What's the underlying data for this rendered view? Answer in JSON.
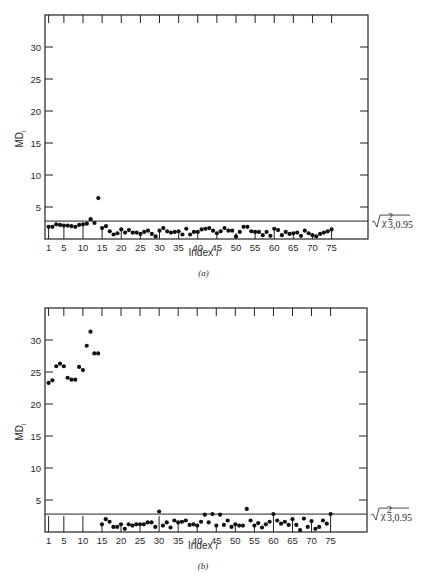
{
  "chart_data": [
    {
      "type": "scatter",
      "panel": "(a)",
      "caption": "(a)",
      "xlabel": "Index i",
      "ylabel": "MD_i",
      "xlim": [
        0,
        80
      ],
      "ylim": [
        0,
        35
      ],
      "xticks": [
        1,
        5,
        10,
        15,
        20,
        25,
        30,
        35,
        40,
        45,
        50,
        55,
        60,
        65,
        70,
        75
      ],
      "yticks": [
        5,
        10,
        15,
        20,
        25,
        30
      ],
      "grid": false,
      "threshold": {
        "value": 2.8,
        "label": "√χ²₃,₀.₉₅"
      },
      "x": [
        1,
        2,
        3,
        4,
        5,
        6,
        7,
        8,
        9,
        10,
        11,
        12,
        13,
        14,
        15,
        16,
        17,
        18,
        19,
        20,
        21,
        22,
        23,
        24,
        25,
        26,
        27,
        28,
        29,
        30,
        31,
        32,
        33,
        34,
        35,
        36,
        37,
        38,
        39,
        40,
        41,
        42,
        43,
        44,
        45,
        46,
        47,
        48,
        49,
        50,
        51,
        52,
        53,
        54,
        55,
        56,
        57,
        58,
        59,
        60,
        61,
        62,
        63,
        64,
        65,
        66,
        67,
        68,
        69,
        70,
        71,
        72,
        73,
        74,
        75
      ],
      "values": [
        1.9,
        1.9,
        2.3,
        2.2,
        2.1,
        2.1,
        2.0,
        1.9,
        2.2,
        2.3,
        2.4,
        3.1,
        2.5,
        6.4,
        1.7,
        2.0,
        1.2,
        0.7,
        0.9,
        1.5,
        1.0,
        1.4,
        1.0,
        1.0,
        0.8,
        1.1,
        1.3,
        0.8,
        0.4,
        1.3,
        1.7,
        1.2,
        1.0,
        1.1,
        1.2,
        0.7,
        1.6,
        0.7,
        1.1,
        1.1,
        1.5,
        1.6,
        1.7,
        1.3,
        0.9,
        1.2,
        1.7,
        1.3,
        1.3,
        0.4,
        1.1,
        1.9,
        1.9,
        1.2,
        1.1,
        1.1,
        0.6,
        1.1,
        0.5,
        1.6,
        1.4,
        0.6,
        1.1,
        0.8,
        0.9,
        1.0,
        0.5,
        1.3,
        0.9,
        0.6,
        0.4,
        0.8,
        1.0,
        1.2,
        1.5
      ]
    },
    {
      "type": "scatter",
      "panel": "(b)",
      "caption": "(b)",
      "xlabel": "Index i",
      "ylabel": "MD_i",
      "xlim": [
        0,
        80
      ],
      "ylim": [
        0,
        35
      ],
      "xticks": [
        1,
        5,
        10,
        15,
        20,
        25,
        30,
        35,
        40,
        45,
        50,
        55,
        60,
        65,
        70,
        75
      ],
      "yticks": [
        5,
        10,
        15,
        20,
        25,
        30
      ],
      "grid": false,
      "threshold": {
        "value": 2.8,
        "label": "√χ²₃,₀.₉₅"
      },
      "x": [
        1,
        2,
        3,
        4,
        5,
        6,
        7,
        8,
        9,
        10,
        11,
        12,
        13,
        14,
        15,
        16,
        17,
        18,
        19,
        20,
        21,
        22,
        23,
        24,
        25,
        26,
        27,
        28,
        29,
        30,
        31,
        32,
        33,
        34,
        35,
        36,
        37,
        38,
        39,
        40,
        41,
        42,
        43,
        44,
        45,
        46,
        47,
        48,
        49,
        50,
        51,
        52,
        53,
        54,
        55,
        56,
        57,
        58,
        59,
        60,
        61,
        62,
        63,
        64,
        65,
        66,
        67,
        68,
        69,
        70,
        71,
        72,
        73,
        74,
        75
      ],
      "values": [
        23.3,
        23.7,
        25.9,
        26.3,
        25.9,
        24.1,
        23.8,
        23.8,
        25.8,
        25.3,
        29.1,
        31.3,
        27.9,
        27.9,
        1.2,
        2.0,
        1.6,
        0.8,
        0.8,
        1.2,
        0.5,
        1.2,
        1.0,
        1.2,
        1.2,
        1.2,
        1.5,
        1.5,
        0.8,
        3.2,
        1.0,
        1.5,
        0.7,
        1.8,
        1.5,
        1.6,
        1.8,
        1.1,
        1.2,
        1.0,
        1.6,
        2.7,
        1.5,
        2.8,
        1.0,
        2.7,
        1.1,
        1.8,
        0.8,
        1.2,
        1.0,
        1.0,
        3.6,
        1.8,
        1.0,
        1.4,
        0.7,
        1.2,
        1.6,
        2.8,
        1.8,
        1.3,
        1.6,
        1.1,
        2.0,
        1.1,
        0.3,
        2.1,
        0.8,
        1.7,
        0.5,
        0.8,
        1.8,
        1.3,
        2.8
      ]
    }
  ]
}
